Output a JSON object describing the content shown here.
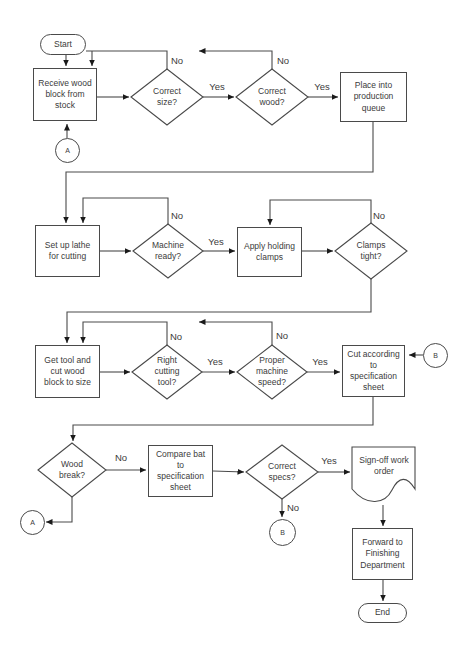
{
  "colors": {
    "line": "#4a4a4a",
    "arrow": "#1a1a1a",
    "text": "#3b3b3b",
    "background": "#ffffff"
  },
  "flowchart": {
    "terminators": {
      "start": "Start",
      "end": "End"
    },
    "connectors": {
      "a": "A",
      "b": "B"
    },
    "processes": {
      "receive_wood": "Receive wood block from stock",
      "place_queue": "Place into production queue",
      "setup_lathe": "Set up lathe for cutting",
      "apply_clamps": "Apply holding clamps",
      "get_tool": "Get tool and cut wood block to size",
      "cut_spec": "Cut according to specification sheet",
      "compare_bat": "Compare bat to specification sheet",
      "signoff": "Sign-off work order",
      "forward_finishing": "Forward to Finishing Department"
    },
    "decisions": {
      "correct_size": "Correct size?",
      "correct_wood": "Correct wood?",
      "machine_ready": "Machine ready?",
      "clamps_tight": "Clamps tight?",
      "right_tool": "Right cutting tool?",
      "proper_speed": "Proper machine speed?",
      "wood_break": "Wood break?",
      "correct_specs": "Correct specs?"
    },
    "labels": {
      "yes": "Yes",
      "no": "No"
    }
  }
}
